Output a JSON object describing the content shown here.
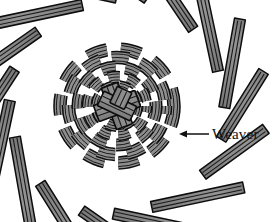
{
  "figure": {
    "type": "basketry-weave-diagram",
    "background_color": "#ffffff"
  },
  "annotation": {
    "label": "Weaver",
    "arrow_icon_name": "left-arrow-icon",
    "arrow_tip_x": 180,
    "arrow_tip_y": 134,
    "arrow_tail_x": 209,
    "arrow_tail_y": 134,
    "text_x": 212,
    "text_y": 139,
    "text_color": "#111111"
  },
  "weave": {
    "center_x": 117,
    "center_y": 106,
    "disk_radius": 57,
    "spoke_outer_radius": 104,
    "spoke_count": 16,
    "spoke_strand_count": 3,
    "spoke_bundle_width": 11,
    "ring_count": 5,
    "ring_radii": [
      20,
      30,
      40,
      49,
      57
    ],
    "ring_bundle_width": 11,
    "colors": {
      "strand_fill": "#8c8c8c",
      "strand_fill_light": "#9a9a9a",
      "strand_fill_dark": "#7a7a7a",
      "strand_outline": "#0d0d0d",
      "strand_groove": "#1a1a1a",
      "background": "#ffffff"
    }
  },
  "center_knot": {
    "description": "Four crossing strand bundles forming a pinwheel plait at the core",
    "bundle_count": 4,
    "bundle_width": 17
  }
}
